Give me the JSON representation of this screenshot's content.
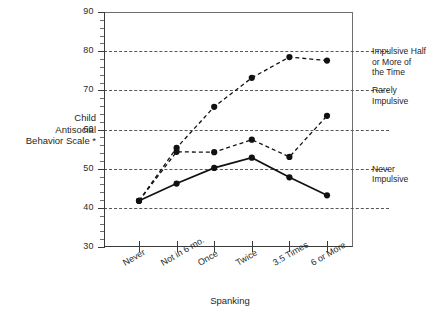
{
  "chart_data": {
    "type": "line",
    "title": "",
    "xlabel": "Spanking",
    "ylabel": "Child Antisocial Behavior Scale *",
    "categories": [
      "Never",
      "Not in 6 mo.",
      "Once",
      "Twice",
      "3.5 Times",
      "6 or More"
    ],
    "ylim": [
      30,
      90
    ],
    "yticks": [
      30,
      40,
      50,
      60,
      70,
      80,
      90
    ],
    "ytick_labels": [
      "30",
      "40",
      "50",
      "60",
      "70",
      "80",
      "90"
    ],
    "grid": "horizontal dashed at 40, 50, 60, 70, 80",
    "gridlines": [
      40,
      50,
      60,
      70,
      80
    ],
    "legend": "none (right-side axis annotations instead)",
    "minor_ticks": "y-axis minor ticks every 2 units",
    "series": [
      {
        "name": "Never Impulsive",
        "style": "solid",
        "marker": "filled-circle",
        "values": [
          41.8,
          46.2,
          50.2,
          52.8,
          47.8,
          43.2
        ]
      },
      {
        "name": "Rarely Impulsive",
        "style": "dashed",
        "marker": "filled-circle",
        "values": [
          41.8,
          54.3,
          54.2,
          57.4,
          53.0,
          63.5
        ]
      },
      {
        "name": "Impulsive Half or More of the Time",
        "style": "dashed",
        "marker": "filled-circle",
        "values": [
          41.8,
          55.3,
          65.8,
          73.2,
          78.5,
          77.6
        ]
      }
    ],
    "right_annotations": [
      {
        "value": 80,
        "text_lines": [
          "Impulsive Half",
          "or More of",
          "the Time"
        ]
      },
      {
        "value": 70,
        "text_lines": [
          "Rarely",
          "Impulsive"
        ]
      },
      {
        "value": 50,
        "text_lines": [
          "Never",
          "Impulsive"
        ]
      }
    ]
  },
  "axis": {
    "y_title_lines": [
      "Child",
      "Antisocial",
      "Behavior Scale *"
    ],
    "x_title": "Spanking"
  },
  "right_labels": {
    "impulsive_half": "Impulsive Half\nor More of\nthe Time",
    "rarely": "Rarely\nImpulsive",
    "never": "Never\nImpulsive"
  }
}
